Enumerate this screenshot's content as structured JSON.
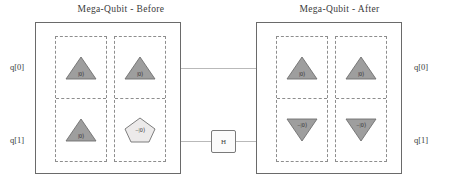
{
  "figure": {
    "kind": "quantum-circuit-diagram",
    "accent_shape_fill": "#9e9e9e",
    "accent_shape_stroke": "#6f6f6f",
    "panel_stroke": "#6a6a6a",
    "register_stroke": "#8e8e8e",
    "wire_color": "#b9b9b9"
  },
  "panels": {
    "before": {
      "title": "Mega-Qubit - Before",
      "registers": [
        {
          "name": "register-a",
          "cells": [
            {
              "position": "top",
              "glyph": "triangle-up",
              "label": "|0⟩"
            },
            {
              "position": "bottom",
              "glyph": "triangle-up",
              "label": "|0⟩"
            }
          ]
        },
        {
          "name": "register-b",
          "cells": [
            {
              "position": "top",
              "glyph": "triangle-up",
              "label": "|0⟩"
            },
            {
              "position": "bottom",
              "glyph": "pentagon",
              "label": "−|0⟩"
            }
          ]
        }
      ]
    },
    "after": {
      "title": "Mega-Qubit - After",
      "registers": [
        {
          "name": "register-a",
          "cells": [
            {
              "position": "top",
              "glyph": "triangle-up",
              "label": "|0⟩"
            },
            {
              "position": "bottom",
              "glyph": "triangle-down",
              "label": "−|0⟩"
            }
          ]
        },
        {
          "name": "register-b",
          "cells": [
            {
              "position": "top",
              "glyph": "triangle-up",
              "label": "|0⟩"
            },
            {
              "position": "bottom",
              "glyph": "triangle-down",
              "label": "−|0⟩"
            }
          ]
        }
      ]
    }
  },
  "qubit_labels": {
    "left_top": "q[0]",
    "left_bottom": "q[1]",
    "right_top": "q[0]",
    "right_bottom": "q[1]"
  },
  "middle_gate": {
    "label": "H",
    "on_wire": "q[1]"
  }
}
